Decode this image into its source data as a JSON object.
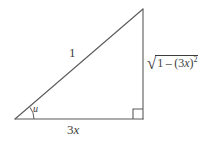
{
  "figure": {
    "type": "right-triangle-diagram",
    "background_color": "#ffffff",
    "line_color": "#5a5a5a",
    "text_color": "#3d3d3d",
    "geometry": {
      "vertices": {
        "left": [
          15,
          119
        ],
        "bottom_right": [
          143,
          119
        ],
        "top_right": [
          143,
          9
        ]
      },
      "right_angle_marker": {
        "x": 133,
        "y": 109,
        "size": 10,
        "at_vertex": "bottom_right"
      },
      "angle_arc": {
        "center": [
          15,
          119
        ],
        "radius": 19,
        "at_vertex": "left"
      }
    },
    "labels": {
      "hypotenuse": "1",
      "base": "3x",
      "base_coefficient": "3",
      "base_variable": "x",
      "angle": "u",
      "opposite_radicand_left": "1",
      "opposite_minus": "–",
      "opposite_group": "(3x)",
      "opposite_group_open": "(",
      "opposite_group_coefficient": "3",
      "opposite_group_variable": "x",
      "opposite_group_close": ")",
      "opposite_exponent": "2",
      "radical_sign": "√",
      "opposite_full": "√(1 – (3x)²)"
    }
  }
}
